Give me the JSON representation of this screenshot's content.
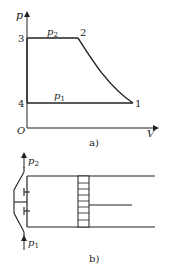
{
  "figure_a": {
    "caption": "a)",
    "axis_y_label": "p",
    "axis_x_label": "V",
    "origin_label": "O",
    "points": [
      {
        "id": "1",
        "label": "1"
      },
      {
        "id": "2",
        "label": "2"
      },
      {
        "id": "3",
        "label": "3"
      },
      {
        "id": "4",
        "label": "4"
      }
    ],
    "line_labels": {
      "upper": {
        "main": "p",
        "sub": "2"
      },
      "lower": {
        "main": "p",
        "sub": "1"
      }
    },
    "line_color": "#333333"
  },
  "figure_b": {
    "caption": "b)",
    "outlet_label": {
      "main": "p",
      "sub": "2"
    },
    "inlet_label": {
      "main": "p",
      "sub": "1"
    }
  }
}
